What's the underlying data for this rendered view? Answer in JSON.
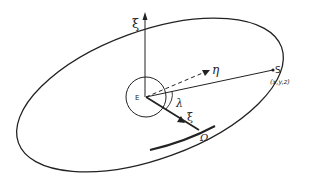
{
  "diagram": {
    "labels": {
      "zeta_axis": "ξ",
      "eta_axis": "η",
      "xi_axis": "ξ",
      "earth": "E",
      "point": "S",
      "point_coords": "(x,y,z)",
      "angle": "λ",
      "node": "Ω"
    },
    "colors": {
      "stroke": "#222222",
      "background": "#ffffff"
    }
  }
}
